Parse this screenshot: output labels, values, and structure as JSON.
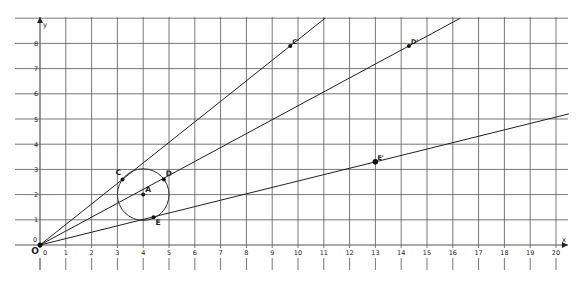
{
  "diagram": {
    "axes": {
      "x_label": "x",
      "y_label": "y",
      "origin_label": "O",
      "x_ticks": [
        "0",
        "1",
        "2",
        "3",
        "4",
        "5",
        "6",
        "7",
        "8",
        "9",
        "10",
        "11",
        "12",
        "13",
        "14",
        "15",
        "16",
        "17",
        "18",
        "19",
        "20"
      ],
      "y_ticks": [
        "0",
        "1",
        "2",
        "3",
        "4",
        "5",
        "6",
        "7",
        "8"
      ],
      "x_range": [
        0,
        20
      ],
      "y_range": [
        0,
        9
      ]
    },
    "circle": {
      "center_label": "A",
      "center": [
        4,
        2
      ],
      "radius": 1
    },
    "points": [
      {
        "label": "A",
        "x": 4,
        "y": 2
      },
      {
        "label": "C",
        "x": 3.2,
        "y": 2.6
      },
      {
        "label": "D",
        "x": 4.8,
        "y": 2.6
      },
      {
        "label": "E",
        "x": 4.4,
        "y": 1.1
      },
      {
        "label": "C'",
        "x": 9.7,
        "y": 7.9
      },
      {
        "label": "D'",
        "x": 14.3,
        "y": 7.9
      },
      {
        "label": "E'",
        "x": 13,
        "y": 3.3
      }
    ],
    "lines": [
      {
        "name": "line-OC",
        "through": "C'"
      },
      {
        "name": "line-OD",
        "through": "D'"
      },
      {
        "name": "line-OE",
        "through": "E'"
      }
    ],
    "colors": {
      "grid": "#555555",
      "line": "#222222",
      "point": "#111111"
    }
  }
}
